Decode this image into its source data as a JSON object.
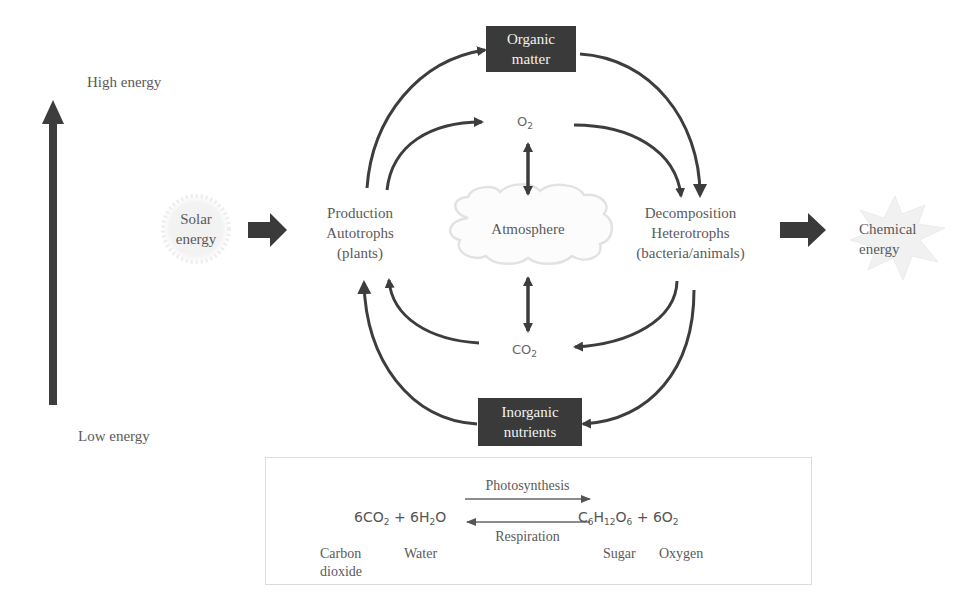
{
  "energy_axis": {
    "high_label": "High energy",
    "low_label": "Low energy"
  },
  "inputs": {
    "solar": {
      "line1": "Solar",
      "line2": "energy"
    }
  },
  "outputs": {
    "chemical": {
      "line1": "Chemical",
      "line2": "energy"
    }
  },
  "nodes": {
    "organic_matter": {
      "line1": "Organic",
      "line2": "matter"
    },
    "inorganic_nutrients": {
      "line1": "Inorganic",
      "line2": "nutrients"
    },
    "production": {
      "line1": "Production",
      "line2": "Autotrophs",
      "line3": "(plants)"
    },
    "decomposition": {
      "line1": "Decomposition",
      "line2": "Heterotrophs",
      "line3": "(bacteria/animals)"
    },
    "atmosphere": {
      "label": "Atmosphere"
    },
    "o2": {
      "base": "O",
      "sub": "2"
    },
    "co2": {
      "base": "CO",
      "sub": "2"
    }
  },
  "equation": {
    "left": {
      "p1": "6CO",
      "s1": "2",
      "p2": " + 6H",
      "s2": "2",
      "p3": "O"
    },
    "right": {
      "p1": "C",
      "s1": "6",
      "p2": "H",
      "s2": "12",
      "p3": "O",
      "s3": "6",
      "p4": " + 6O",
      "s4": "2"
    },
    "forward_label": "Photosynthesis",
    "reverse_label": "Respiration",
    "names": {
      "carbon_dioxide_1": "Carbon",
      "carbon_dioxide_2": "dioxide",
      "water": "Water",
      "sugar": "Sugar",
      "oxygen": "Oxygen"
    }
  },
  "colors": {
    "arrow": "#3d3d3d",
    "box_fill": "#3a3a3a",
    "box_text": "#f2f2f2",
    "label_text": "#5a5a5a",
    "cloud_outline": "#e2e2e2",
    "glow": "#ececec",
    "eq_border": "#dcdcdc"
  }
}
